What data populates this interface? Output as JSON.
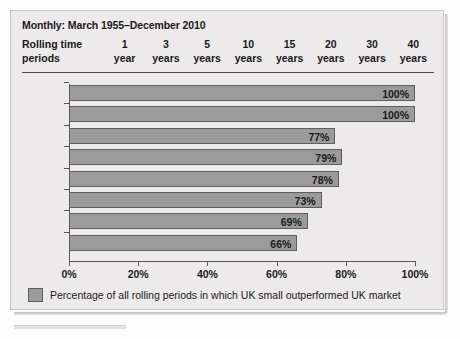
{
  "panel": {
    "title": "Monthly: March 1955–December 2010",
    "row_header_line1": "Rolling time",
    "row_header_line2": "periods",
    "column_headers": [
      {
        "number": "1",
        "unit": "year"
      },
      {
        "number": "3",
        "unit": "years"
      },
      {
        "number": "5",
        "unit": "years"
      },
      {
        "number": "10",
        "unit": "years"
      },
      {
        "number": "15",
        "unit": "years"
      },
      {
        "number": "20",
        "unit": "years"
      },
      {
        "number": "30",
        "unit": "years"
      },
      {
        "number": "40",
        "unit": "years"
      }
    ]
  },
  "legend": {
    "label": "Percentage of all rolling periods in which UK small outperformed UK market",
    "swatch_color": "#9b9b9b"
  },
  "colors": {
    "bar_fill": "#9b9b9b",
    "bar_border": "#5e5e5e",
    "panel_bg": "#eceaea",
    "axis": "#555555",
    "text": "#1a1a1a"
  },
  "chart_data": {
    "type": "bar",
    "orientation": "horizontal",
    "title": "Monthly: March 1955–December 2010",
    "xlabel": "",
    "ylabel": "",
    "categories": [
      "40 years",
      "30 years",
      "20 years",
      "15 years",
      "10 years",
      "5 years",
      "3 years",
      "1 year"
    ],
    "values": [
      100,
      100,
      77,
      79,
      78,
      73,
      69,
      66
    ],
    "data_labels": [
      "100%",
      "100%",
      "77%",
      "79%",
      "78%",
      "73%",
      "69%",
      "66%"
    ],
    "xlim": [
      0,
      100
    ],
    "xticks": [
      0,
      20,
      40,
      60,
      80,
      100
    ],
    "xtick_labels": [
      "0%",
      "20%",
      "40%",
      "60%",
      "80%",
      "100%"
    ],
    "grid": false,
    "legend_position": "bottom",
    "series": [
      {
        "name": "Percentage of all rolling periods in which UK small outperformed UK market",
        "values": [
          100,
          100,
          77,
          79,
          78,
          73,
          69,
          66
        ]
      }
    ]
  }
}
